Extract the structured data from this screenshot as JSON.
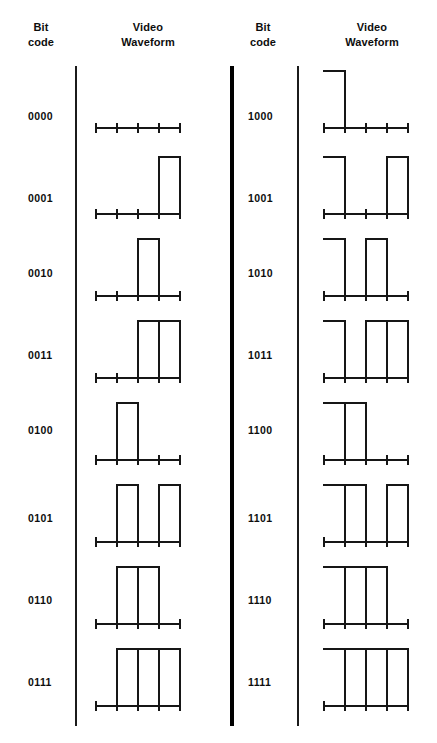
{
  "figure": {
    "headers": {
      "bit_code_left": "Bit\ncode",
      "waveform_left": "Video\nWaveform",
      "bit_code_right": "Bit\ncode",
      "waveform_right": "Video\nWaveform"
    },
    "ink_color": "#161616",
    "background_color": "#ffffff",
    "divider_color": "#1b1b1b"
  },
  "chart_data": {
    "type": "table",
    "xlabel": "Time (4 bit segments)",
    "ylabel": "Video level",
    "columns": [
      "Bit code",
      "Video Waveform"
    ],
    "segments_per_code": 4,
    "tick_count": 5,
    "levels": {
      "low": 0,
      "high": 1
    },
    "left_panel": {
      "rows": [
        {
          "code": "0000",
          "segments": [
            0,
            0,
            0,
            0
          ]
        },
        {
          "code": "0001",
          "segments": [
            0,
            0,
            0,
            1
          ]
        },
        {
          "code": "0010",
          "segments": [
            0,
            0,
            1,
            0
          ]
        },
        {
          "code": "0011",
          "segments": [
            0,
            0,
            1,
            1
          ]
        },
        {
          "code": "0100",
          "segments": [
            0,
            1,
            0,
            0
          ]
        },
        {
          "code": "0101",
          "segments": [
            0,
            1,
            0,
            1
          ]
        },
        {
          "code": "0110",
          "segments": [
            0,
            1,
            1,
            0
          ]
        },
        {
          "code": "0111",
          "segments": [
            0,
            1,
            1,
            1
          ]
        }
      ]
    },
    "right_panel": {
      "rows": [
        {
          "code": "1000",
          "segments": [
            1,
            0,
            0,
            0
          ]
        },
        {
          "code": "1001",
          "segments": [
            1,
            0,
            0,
            1
          ]
        },
        {
          "code": "1010",
          "segments": [
            1,
            0,
            1,
            0
          ]
        },
        {
          "code": "1011",
          "segments": [
            1,
            0,
            1,
            1
          ]
        },
        {
          "code": "1100",
          "segments": [
            1,
            1,
            0,
            0
          ]
        },
        {
          "code": "1101",
          "segments": [
            1,
            1,
            0,
            1
          ]
        },
        {
          "code": "1110",
          "segments": [
            1,
            1,
            1,
            0
          ]
        },
        {
          "code": "1111",
          "segments": [
            1,
            1,
            1,
            1
          ]
        }
      ]
    }
  },
  "layout": {
    "row_baselines": [
      128,
      214,
      296,
      378,
      460,
      542,
      624,
      706
    ],
    "code_label_offsets": [
      110,
      192,
      267,
      349,
      424,
      512,
      594,
      676
    ],
    "pulse_height": 57,
    "segment_width": 21,
    "baseline_span": 84
  }
}
